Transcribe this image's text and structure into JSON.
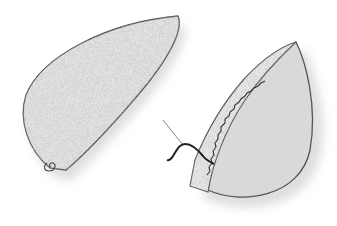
{
  "illustration": {
    "subject": "sewing felt pieces",
    "colors": {
      "background": "#ffffff",
      "felt_light": "#e4e4e4",
      "felt_speckle": "#c8c8c8",
      "felt_back": "#d6d6d6",
      "outline": "#444444",
      "thread": "#222222",
      "needle": "#777777"
    }
  }
}
